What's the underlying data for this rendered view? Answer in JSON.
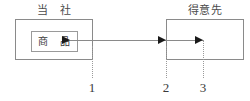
{
  "diagram": {
    "entities": [
      {
        "id": "company",
        "label": "当　社",
        "inner_item": "商　品"
      },
      {
        "id": "customer",
        "label": "得意先"
      }
    ],
    "flow": {
      "direction": "left-to-right",
      "arrowhead_count": 3
    },
    "reference_markers": [
      {
        "number": "1"
      },
      {
        "number": "2"
      },
      {
        "number": "3"
      }
    ],
    "colors": {
      "box_border": "#8a8a8a",
      "inner_box_border": "#9a9a9a",
      "flow_line": "#8a8a8a",
      "arrowhead": "#1a1a1a",
      "dotted_line": "#9a9a9a",
      "text": "#3a3a3a",
      "background": "#ffffff"
    }
  }
}
